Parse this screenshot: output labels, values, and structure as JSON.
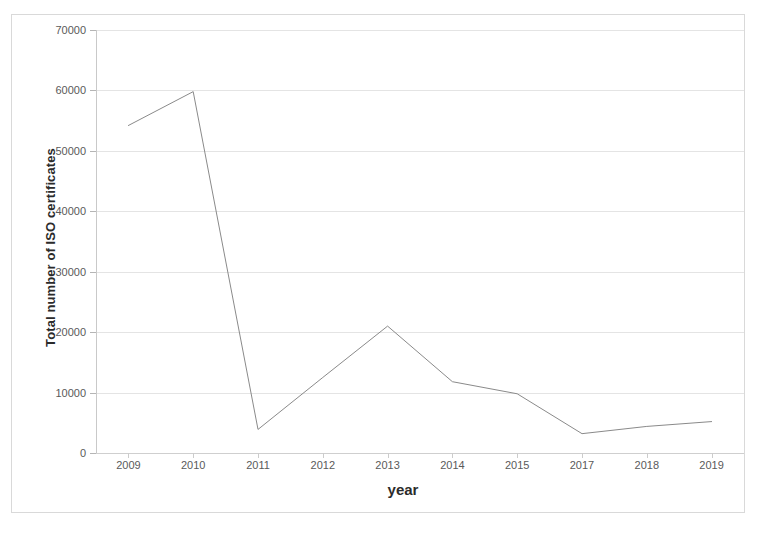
{
  "figure": {
    "border_color": "#d9d9d9",
    "background": "#ffffff"
  },
  "chart_data": {
    "type": "line",
    "title": "",
    "xlabel": "year",
    "ylabel": "Total number of ISO certificates",
    "categories": [
      "2009",
      "2010",
      "2011",
      "2012",
      "2013",
      "2014",
      "2015",
      "2017",
      "2018",
      "2019"
    ],
    "values": [
      54200,
      59800,
      3900,
      12500,
      21000,
      11800,
      9800,
      3200,
      4400,
      5200
    ],
    "series": [
      {
        "name": "Total number of ISO certificates",
        "values": [
          54200,
          59800,
          3900,
          12500,
          21000,
          11800,
          9800,
          3200,
          4400,
          5200
        ],
        "color": "#8a8a8a",
        "line_width": 1,
        "markers": false
      }
    ],
    "ylim": [
      0,
      70000
    ],
    "ytick_labels": [
      "0",
      "10000",
      "20000",
      "30000",
      "40000",
      "50000",
      "60000",
      "70000"
    ],
    "ytick_values": [
      0,
      10000,
      20000,
      30000,
      40000,
      50000,
      60000,
      70000
    ],
    "grid": true,
    "grid_axis": "y",
    "grid_color": "#e4e4e4",
    "legend": false,
    "legend_position": "none",
    "axis_color": "#c9c9c9",
    "tick_label_color": "#5a5a5a",
    "axis_title_color": "#2b2b2b"
  }
}
